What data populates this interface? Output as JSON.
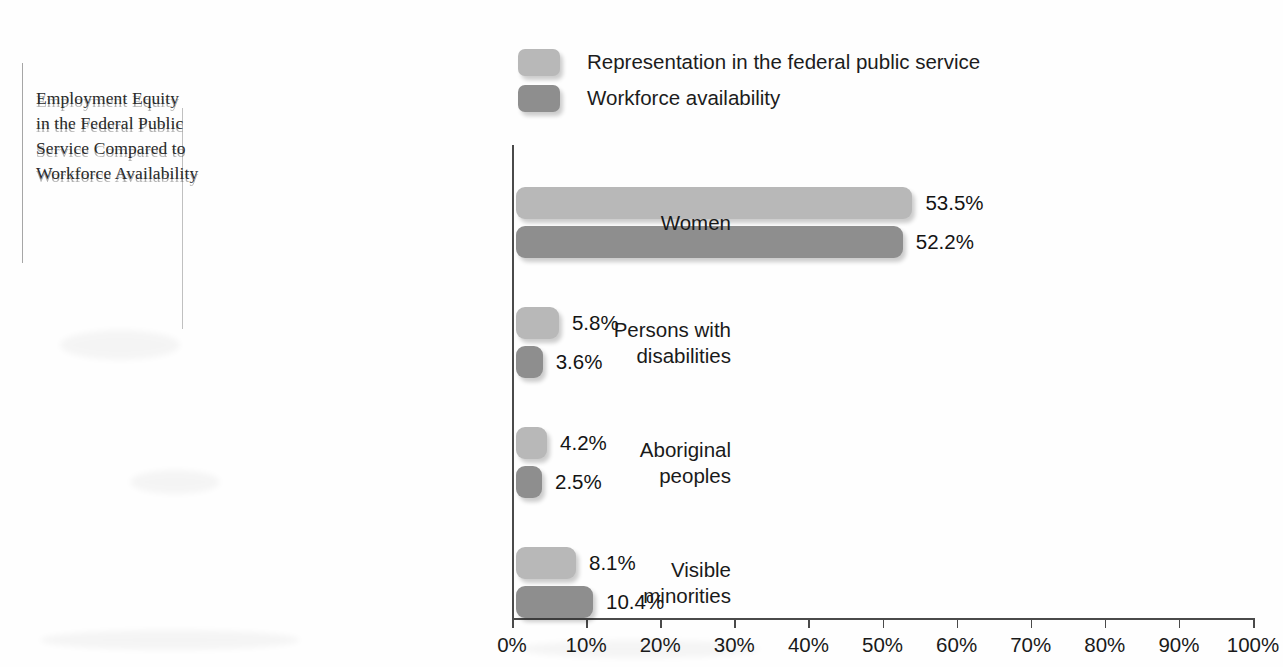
{
  "title": {
    "lines": [
      "Employment Equity",
      "in the Federal Public",
      "Service Compared to",
      "Workforce Availability"
    ],
    "full": "Employment Equity in the Federal Public Service Compared to Workforce Availability"
  },
  "legend": {
    "items": [
      {
        "label": "Representation in the federal public service",
        "color": "#b8b8b8"
      },
      {
        "label": "Workforce availability",
        "color": "#8e8e8e"
      }
    ]
  },
  "axis": {
    "ticks": [
      "0%",
      "10%",
      "20%",
      "30%",
      "40%",
      "50%",
      "60%",
      "70%",
      "80%",
      "90%",
      "100%"
    ]
  },
  "groups": [
    {
      "label_lines": [
        "Women"
      ],
      "bars": [
        {
          "series": 0,
          "value": 53.5,
          "value_label": "53.5%"
        },
        {
          "series": 1,
          "value": 52.2,
          "value_label": "52.2%"
        }
      ]
    },
    {
      "label_lines": [
        "Persons with",
        "disabilities"
      ],
      "bars": [
        {
          "series": 0,
          "value": 5.8,
          "value_label": "5.8%"
        },
        {
          "series": 1,
          "value": 3.6,
          "value_label": "3.6%"
        }
      ]
    },
    {
      "label_lines": [
        "Aboriginal",
        "peoples"
      ],
      "bars": [
        {
          "series": 0,
          "value": 4.2,
          "value_label": "4.2%"
        },
        {
          "series": 1,
          "value": 2.5,
          "value_label": "2.5%"
        }
      ]
    },
    {
      "label_lines": [
        "Visible",
        "minorities"
      ],
      "bars": [
        {
          "series": 0,
          "value": 8.1,
          "value_label": "8.1%"
        },
        {
          "series": 1,
          "value": 10.4,
          "value_label": "10.4%"
        }
      ]
    }
  ],
  "chart_data": {
    "type": "bar",
    "orientation": "horizontal",
    "xlabel": "",
    "ylabel": "",
    "xlim": [
      0,
      100
    ],
    "x_tick_labels": [
      "0%",
      "10%",
      "20%",
      "30%",
      "40%",
      "50%",
      "60%",
      "70%",
      "80%",
      "90%",
      "100%"
    ],
    "x_tick_values": [
      0,
      10,
      20,
      30,
      40,
      50,
      60,
      70,
      80,
      90,
      100
    ],
    "grid": false,
    "legend_position": "top",
    "categories": [
      "Women",
      "Persons with disabilities",
      "Aboriginal peoples",
      "Visible minorities"
    ],
    "series": [
      {
        "name": "Representation in the federal public service",
        "color": "#b8b8b8",
        "values": [
          53.5,
          5.8,
          4.2,
          8.1
        ],
        "value_labels": [
          "53.5%",
          "5.8%",
          "4.2%",
          "8.1%"
        ]
      },
      {
        "name": "Workforce availability",
        "color": "#8e8e8e",
        "values": [
          52.2,
          3.6,
          2.5,
          10.4
        ],
        "value_labels": [
          "52.2%",
          "3.6%",
          "2.5%",
          "10.4%"
        ]
      }
    ],
    "units": "percent"
  }
}
